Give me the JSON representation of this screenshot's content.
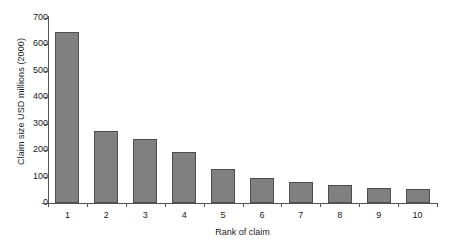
{
  "chart_data": {
    "type": "bar",
    "title": "",
    "xlabel": "Rank of claim",
    "ylabel": "Claim size USD millions (2000)",
    "categories": [
      "1",
      "2",
      "3",
      "4",
      "5",
      "6",
      "7",
      "8",
      "9",
      "10"
    ],
    "values": [
      648,
      273,
      242,
      192,
      128,
      94,
      81,
      70,
      58,
      54
    ],
    "ylim": [
      0,
      700
    ],
    "yticks": [
      0,
      100,
      200,
      300,
      400,
      500,
      600,
      700
    ],
    "ytick_labels": [
      "0",
      "100",
      "200",
      "300",
      "400",
      "500",
      "600",
      "700"
    ],
    "grid": false,
    "legend": false,
    "series": [
      {
        "name": "Claim size",
        "values": [
          648,
          273,
          242,
          192,
          128,
          94,
          81,
          70,
          58,
          54
        ]
      }
    ],
    "colors": {
      "bar_fill": "#808080",
      "bar_border": "#4d4d4d",
      "axis": "#555555",
      "text": "#1a1a1a",
      "background": "#ffffff"
    }
  }
}
